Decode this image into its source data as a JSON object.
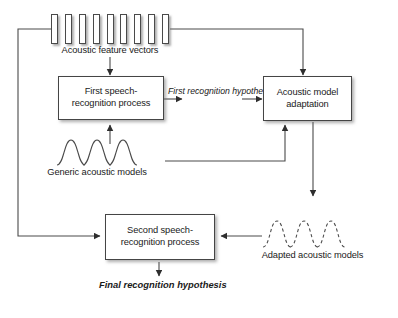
{
  "diagram": {
    "background_color": "#ffffff",
    "line_color": "#3a3a3a",
    "text_color": "#1a1a1a"
  },
  "nodes": {
    "feature_vectors": {
      "label": "Acoustic feature vectors",
      "bar_count": 9
    },
    "first_process": {
      "line1": "First speech-",
      "line2": "recognition process"
    },
    "acoustic_model_adaptation": {
      "line1": "Acoustic model",
      "line2": "adaptation"
    },
    "generic_models": {
      "label": "Generic acoustic models",
      "curve_count": 3,
      "style": "solid"
    },
    "second_process": {
      "line1": "Second speech-",
      "line2": "recognition process"
    },
    "adapted_models": {
      "label": "Adapted acoustic models",
      "curve_count": 3,
      "style": "dashed"
    }
  },
  "edges": {
    "first_hypothesis": {
      "line1": "First recognition",
      "line2": "hypothesis"
    },
    "final_hypothesis": {
      "line1": "Final recognition",
      "line2": "hypothesis"
    }
  }
}
